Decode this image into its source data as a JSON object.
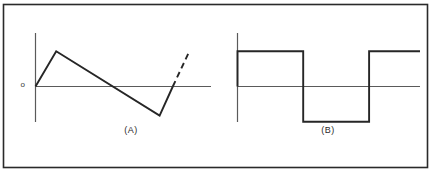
{
  "figure": {
    "background_color": "#ffffff",
    "border_color": "#2a2a2a",
    "waveform_color": "#262626",
    "axis_color": "#555555",
    "panels": [
      {
        "id": "A",
        "label": "(A)",
        "waveform": "sawtooth"
      },
      {
        "id": "B",
        "label": "(B)",
        "waveform": "square"
      }
    ],
    "origin_label": "o"
  },
  "chart_data": [
    {
      "type": "line",
      "id": "A",
      "title": "(A)",
      "subtitle": "",
      "xlabel": "",
      "ylabel": "",
      "grid": false,
      "legend": "none",
      "axes": {
        "y_axis_at_x": 0,
        "x_axis_y": 0,
        "xlim": [
          0,
          10
        ],
        "ylim": [
          -1.15,
          1.3
        ],
        "origin_tick_label": "o"
      },
      "annotations": [
        {
          "text": "o",
          "x": -0.45,
          "y": 0,
          "role": "origin-label"
        }
      ],
      "series": [
        {
          "name": "sawtooth-solid",
          "style": "solid",
          "x": [
            0.0,
            1.26,
            7.57,
            8.37
          ],
          "y": [
            0.0,
            0.885,
            -0.73,
            0.0
          ]
        },
        {
          "name": "sawtooth-dashed-extension",
          "style": "dashed",
          "x": [
            8.37,
            9.4
          ],
          "y": [
            0.0,
            0.9
          ]
        }
      ]
    },
    {
      "type": "line",
      "id": "B",
      "title": "(B)",
      "subtitle": "",
      "xlabel": "",
      "ylabel": "",
      "grid": false,
      "legend": "none",
      "axes": {
        "y_axis_at_x": 0,
        "x_axis_y": 0,
        "xlim": [
          0,
          10
        ],
        "ylim": [
          -1.15,
          1.3
        ],
        "origin_tick_label": ""
      },
      "annotations": [],
      "series": [
        {
          "name": "square-wave",
          "style": "solid",
          "x": [
            0.0,
            0.0,
            3.6,
            3.6,
            7.21,
            7.21,
            10.0
          ],
          "y": [
            0.0,
            0.885,
            0.885,
            -0.885,
            -0.885,
            0.885,
            0.885
          ]
        }
      ]
    }
  ]
}
